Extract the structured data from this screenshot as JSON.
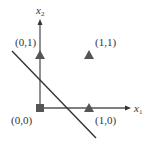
{
  "diagram": {
    "axes": {
      "x_label": "x",
      "x_subscript": "1",
      "y_label": "x",
      "y_subscript": "2"
    },
    "points": [
      {
        "label": "(0,0)",
        "shape": "square",
        "class": "0"
      },
      {
        "label": "(0,1)",
        "shape": "triangle",
        "class": "1"
      },
      {
        "label": "(1,1)",
        "shape": "triangle",
        "class": "1"
      },
      {
        "label": "(1,0)",
        "shape": "triangle",
        "class": "1"
      }
    ],
    "decision_boundary": "line separating (0,0) from other points",
    "colors": {
      "marker": "#555555",
      "axis": "#555555",
      "line": "#333333"
    }
  }
}
